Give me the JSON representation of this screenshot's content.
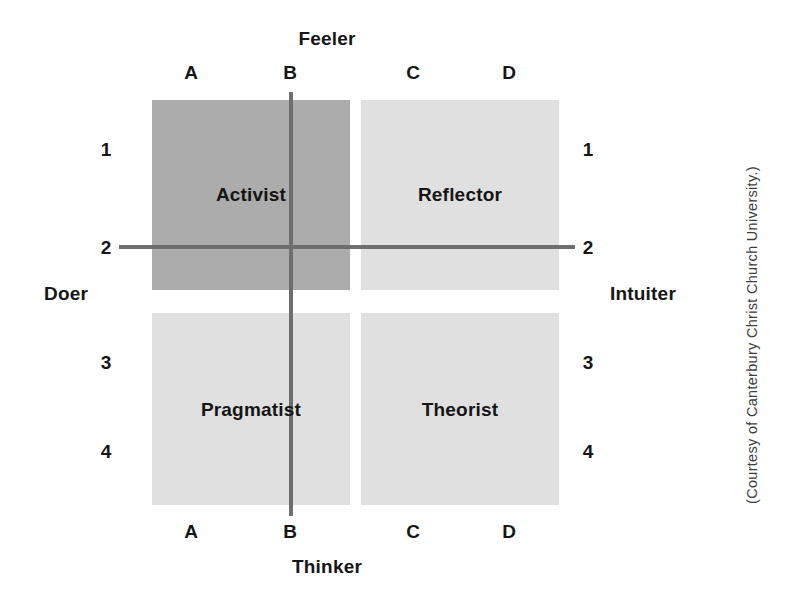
{
  "figure": {
    "type": "2x2-quadrant-matrix",
    "axes": {
      "top_label": "Feeler",
      "bottom_label": "Thinker",
      "left_label": "Doer",
      "right_label": "Intuiter"
    },
    "column_letters": [
      "A",
      "B",
      "C",
      "D"
    ],
    "row_numbers_upper": [
      "1",
      "2"
    ],
    "row_numbers_lower": [
      "3",
      "4"
    ],
    "quadrants": [
      {
        "id": "activist",
        "label": "Activist",
        "position": "top-left",
        "fill": "#acacac"
      },
      {
        "id": "reflector",
        "label": "Reflector",
        "position": "top-right",
        "fill": "#e0e0e0"
      },
      {
        "id": "pragmatist",
        "label": "Pragmatist",
        "position": "bottom-left",
        "fill": "#e0e0e0"
      },
      {
        "id": "theorist",
        "label": "Theorist",
        "position": "bottom-right",
        "fill": "#e0e0e0"
      }
    ],
    "axis_line_color": "#6e6e6e",
    "credit": "(Courtesy of Canterbury Christ Church University.)"
  },
  "chart_data": {
    "type": "table",
    "title": "",
    "xlabel": "Thinker – Feeler",
    "ylabel": "Doer – Intuiter",
    "categories": [
      "A",
      "B",
      "C",
      "D"
    ],
    "rows": [
      "1",
      "2",
      "3",
      "4"
    ],
    "cells": [
      {
        "name": "Activist",
        "x_range": "A–B",
        "y_range": "1−2",
        "shade": "dark"
      },
      {
        "name": "Reflector",
        "x_range": "C–D",
        "y_range": "1−2",
        "shade": "light"
      },
      {
        "name": "Pragmatist",
        "x_range": "A–B",
        "y_range": "3−4",
        "shade": "light"
      },
      {
        "name": "Theorist",
        "x_range": "C–D",
        "y_range": "3−4",
        "shade": "light"
      }
    ],
    "legend": [],
    "grid": true
  }
}
